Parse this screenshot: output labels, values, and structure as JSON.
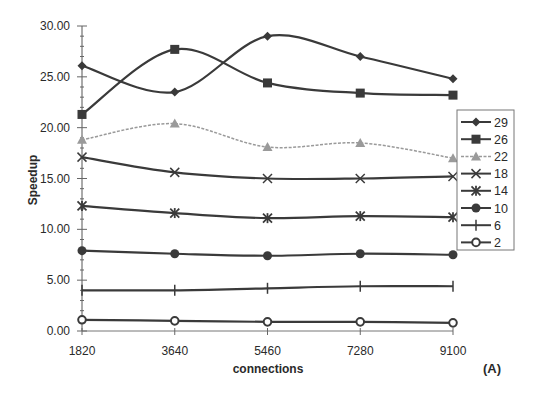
{
  "chart_data": {
    "type": "line",
    "title": "",
    "xlabel": "connections",
    "ylabel": "Speedup",
    "panel_label": "(A)",
    "x": [
      1820,
      3640,
      5460,
      7280,
      9100
    ],
    "x_tick_labels": [
      "1820",
      "3640",
      "5460",
      "7280",
      "9100"
    ],
    "ylim": [
      0,
      30
    ],
    "y_ticks": [
      0,
      5,
      10,
      15,
      20,
      25,
      30
    ],
    "y_tick_labels": [
      "0.00",
      "5.00",
      "10.00",
      "15.00",
      "20.00",
      "25.00",
      "30.00"
    ],
    "grid": false,
    "smoothed": true,
    "legend_position": "right",
    "series": [
      {
        "name": "29",
        "marker": "diamond",
        "color": "#3a3a3a",
        "dashed": false,
        "values": [
          26.1,
          23.5,
          29.0,
          27.0,
          24.8
        ]
      },
      {
        "name": "26",
        "marker": "square",
        "color": "#3a3a3a",
        "dashed": false,
        "values": [
          21.3,
          27.7,
          24.4,
          23.4,
          23.2
        ]
      },
      {
        "name": "22",
        "marker": "triangle",
        "color": "#9a9a9a",
        "dashed": true,
        "values": [
          18.8,
          20.4,
          18.1,
          18.5,
          17.0
        ]
      },
      {
        "name": "18",
        "marker": "x",
        "color": "#3a3a3a",
        "dashed": false,
        "values": [
          17.1,
          15.6,
          15.0,
          15.0,
          15.2
        ]
      },
      {
        "name": "14",
        "marker": "asterisk",
        "color": "#3a3a3a",
        "dashed": false,
        "values": [
          12.3,
          11.6,
          11.1,
          11.3,
          11.2
        ]
      },
      {
        "name": "10",
        "marker": "circle-filled",
        "color": "#3a3a3a",
        "dashed": false,
        "values": [
          7.9,
          7.6,
          7.4,
          7.6,
          7.5
        ]
      },
      {
        "name": "6",
        "marker": "plus",
        "color": "#3a3a3a",
        "dashed": false,
        "values": [
          4.0,
          4.0,
          4.2,
          4.4,
          4.4
        ]
      },
      {
        "name": "2",
        "marker": "circle-open",
        "color": "#3a3a3a",
        "dashed": false,
        "values": [
          1.1,
          1.0,
          0.9,
          0.9,
          0.8
        ]
      }
    ]
  }
}
